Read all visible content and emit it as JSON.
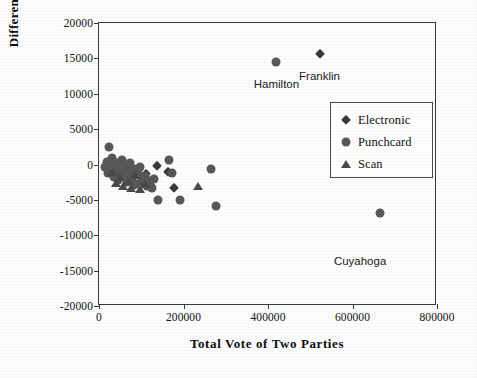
{
  "chart_data": {
    "type": "scatter",
    "title": "",
    "xlabel": "Total Vote of Two Parties",
    "ylabel": "Difference",
    "xlim": [
      0,
      800000
    ],
    "ylim": [
      -20000,
      20000
    ],
    "xticks": [
      "0",
      "200000",
      "400000",
      "600000",
      "800000"
    ],
    "xtick_values": [
      0,
      200000,
      400000,
      600000,
      800000
    ],
    "yticks": [
      "20000",
      "15000",
      "10000",
      "5000",
      "0",
      "-5000",
      "-10000",
      "-15000",
      "-20000"
    ],
    "ytick_values": [
      20000,
      15000,
      10000,
      5000,
      0,
      -5000,
      -10000,
      -15000,
      -20000
    ],
    "grid": false,
    "legend_position": "upper right",
    "legend": [
      {
        "label": "Electronic",
        "marker": "diamond"
      },
      {
        "label": "Punchcard",
        "marker": "circle"
      },
      {
        "label": "Scan",
        "marker": "triangle"
      }
    ],
    "annotations": [
      {
        "text": "Hamilton",
        "x": 420000,
        "y": 11200
      },
      {
        "text": "Franklin",
        "x": 522000,
        "y": 12400
      },
      {
        "text": "Cuyahoga",
        "x": 618000,
        "y": -13800
      }
    ],
    "series": [
      {
        "name": "Electronic",
        "marker": "diamond",
        "color": "#3a3a3a",
        "points": [
          [
            20000,
            -400
          ],
          [
            26000,
            -900
          ],
          [
            33000,
            300
          ],
          [
            38000,
            -1500
          ],
          [
            44000,
            -700
          ],
          [
            52000,
            500
          ],
          [
            58000,
            -1800
          ],
          [
            63000,
            -500
          ],
          [
            71000,
            -2300
          ],
          [
            78000,
            -1100
          ],
          [
            86000,
            -2900
          ],
          [
            94000,
            -600
          ],
          [
            103000,
            -2600
          ],
          [
            112000,
            -1400
          ],
          [
            124000,
            -3100
          ],
          [
            137000,
            -250
          ],
          [
            163000,
            -1050
          ],
          [
            177000,
            -3350
          ],
          [
            522000,
            15600
          ]
        ]
      },
      {
        "name": "Punchcard",
        "marker": "circle",
        "color": "#585858",
        "points": [
          [
            14000,
            -300
          ],
          [
            18000,
            400
          ],
          [
            21000,
            -1200
          ],
          [
            24000,
            2450
          ],
          [
            28000,
            -250
          ],
          [
            31000,
            900
          ],
          [
            35000,
            -1700
          ],
          [
            39000,
            -400
          ],
          [
            42000,
            150
          ],
          [
            46000,
            -2200
          ],
          [
            50000,
            -800
          ],
          [
            54000,
            600
          ],
          [
            58000,
            -1500
          ],
          [
            61000,
            -300
          ],
          [
            66000,
            -2500
          ],
          [
            70000,
            -1000
          ],
          [
            74000,
            200
          ],
          [
            79000,
            -1900
          ],
          [
            83000,
            -700
          ],
          [
            88000,
            -2800
          ],
          [
            92000,
            -1300
          ],
          [
            97000,
            -400
          ],
          [
            102000,
            -2100
          ],
          [
            108000,
            -1600
          ],
          [
            114000,
            -3000
          ],
          [
            120000,
            -2400
          ],
          [
            126000,
            -3300
          ],
          [
            131000,
            -2000
          ],
          [
            140000,
            -5000
          ],
          [
            165000,
            600
          ],
          [
            172000,
            -1250
          ],
          [
            192000,
            -5050
          ],
          [
            266000,
            -700
          ],
          [
            276000,
            -5900
          ],
          [
            420000,
            14500
          ],
          [
            665000,
            -6800
          ]
        ]
      },
      {
        "name": "Scan",
        "marker": "triangle",
        "color": "#4a4a4a",
        "points": [
          [
            30000,
            -1100
          ],
          [
            41000,
            -2600
          ],
          [
            49000,
            -1800
          ],
          [
            57000,
            -3100
          ],
          [
            68000,
            -2300
          ],
          [
            76000,
            -3300
          ],
          [
            85000,
            -1500
          ],
          [
            96000,
            -3400
          ],
          [
            110000,
            -2700
          ],
          [
            235000,
            -3050
          ]
        ]
      }
    ]
  }
}
